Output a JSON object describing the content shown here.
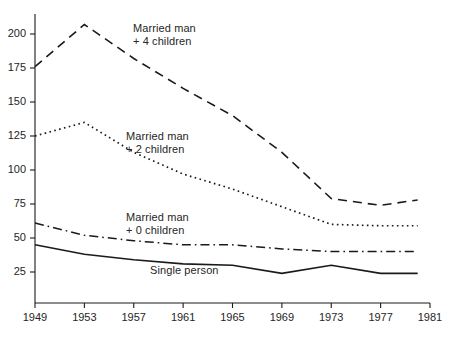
{
  "chart_data": {
    "type": "line",
    "title": "",
    "subtitle": "",
    "xlabel": "",
    "ylabel": "",
    "x": [
      1949,
      1950,
      1951,
      1952,
      1953,
      1954,
      1955,
      1956,
      1957,
      1958,
      1959,
      1960,
      1961,
      1962,
      1963,
      1964,
      1965,
      1966,
      1967,
      1968,
      1969,
      1970,
      1971,
      1972,
      1973,
      1974,
      1975,
      1976,
      1977,
      1978,
      1979,
      1980
    ],
    "xlim": [
      1949,
      1981
    ],
    "ylim": [
      0,
      215
    ],
    "x_ticks": [
      1949,
      1953,
      1957,
      1961,
      1965,
      1969,
      1973,
      1977,
      1981
    ],
    "x_tick_labels": [
      "1949",
      "1953",
      "1957",
      "1961",
      "1965",
      "1969",
      "1973",
      "1977",
      "1981"
    ],
    "y_ticks": [
      25,
      50,
      75,
      100,
      125,
      150,
      175,
      200
    ],
    "y_tick_labels": [
      "25",
      "50",
      "75",
      "100",
      "125",
      "150",
      "175",
      "200"
    ],
    "grid": false,
    "legend": "inline-annotations",
    "series": [
      {
        "name": "Married man + 4 children",
        "label_line1": "Married man",
        "label_line2": "+ 4 children",
        "style": "dashed",
        "color": "#1a1a1a",
        "x": [
          1949,
          1953,
          1957,
          1961,
          1965,
          1969,
          1973,
          1977,
          1980
        ],
        "values": [
          176,
          207,
          182,
          160,
          140,
          113,
          79,
          74,
          78
        ]
      },
      {
        "name": "Married man + 2 children",
        "label_line1": "Married man",
        "label_line2": "+ 2 children",
        "style": "dotted",
        "color": "#1a1a1a",
        "x": [
          1949,
          1953,
          1957,
          1961,
          1965,
          1969,
          1973,
          1977,
          1980
        ],
        "values": [
          125,
          135,
          113,
          97,
          86,
          73,
          60,
          59,
          59
        ]
      },
      {
        "name": "Married man + 0 children",
        "label_line1": "Married man",
        "label_line2": "+ 0 children",
        "style": "dash-dot",
        "color": "#1a1a1a",
        "x": [
          1949,
          1953,
          1957,
          1961,
          1965,
          1969,
          1973,
          1977,
          1980
        ],
        "values": [
          61,
          52,
          48,
          45,
          45,
          42,
          40,
          40,
          40
        ]
      },
      {
        "name": "Single person",
        "label_line1": "Single person",
        "label_line2": "",
        "style": "solid",
        "color": "#1a1a1a",
        "x": [
          1949,
          1953,
          1957,
          1961,
          1965,
          1969,
          1973,
          1977,
          1980
        ],
        "values": [
          45,
          38,
          34,
          31,
          30,
          24,
          30,
          24,
          24
        ]
      }
    ],
    "annotations": [
      {
        "text": "Married man + 4 children",
        "x": 1957,
        "y": 190
      },
      {
        "text": "Married man + 2 children",
        "x": 1957,
        "y": 118
      },
      {
        "text": "Married man + 0 children",
        "x": 1957,
        "y": 62
      },
      {
        "text": "Single person",
        "x": 1959,
        "y": 26
      }
    ]
  },
  "axes": {
    "y_labels": [
      "200",
      "175",
      "150",
      "125",
      "100",
      "75",
      "50",
      "25"
    ],
    "x_labels": [
      "1949",
      "1953",
      "1957",
      "1961",
      "1965",
      "1969",
      "1973",
      "1977",
      "1981"
    ]
  },
  "annots": {
    "four_children": {
      "l1": "Married man",
      "l2": "+ 4 children"
    },
    "two_children": {
      "l1": "Married man",
      "l2": "+ 2 children"
    },
    "zero_children": {
      "l1": "Married man",
      "l2": "+ 0 children"
    },
    "single": {
      "l1": "Single person"
    }
  }
}
